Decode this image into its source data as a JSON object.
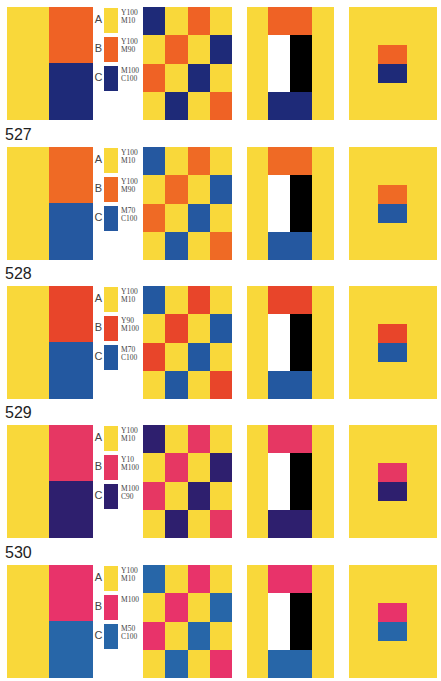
{
  "checker_pattern": [
    [
      "C",
      "A",
      "B",
      "A"
    ],
    [
      "A",
      "B",
      "A",
      "C"
    ],
    [
      "B",
      "A",
      "C",
      "A"
    ],
    [
      "A",
      "C",
      "A",
      "B"
    ]
  ],
  "rows": [
    {
      "number": "526",
      "colors": {
        "A": "#f9d83a",
        "B": "#ef6225",
        "C": "#1e2a78"
      },
      "labels": {
        "A": "A",
        "B": "B",
        "C": "C"
      },
      "codes": {
        "A": "Y100\nM10",
        "B": "Y100\nM90",
        "C": "M100\nC100"
      }
    },
    {
      "number": "527",
      "colors": {
        "A": "#f9d83a",
        "B": "#ef6a25",
        "C": "#2558a0"
      },
      "labels": {
        "A": "A",
        "B": "B",
        "C": "C"
      },
      "codes": {
        "A": "Y100\nM10",
        "B": "Y100\nM90",
        "C": "M70\nC100"
      }
    },
    {
      "number": "528",
      "colors": {
        "A": "#f9d83a",
        "B": "#e8452a",
        "C": "#2358a0"
      },
      "labels": {
        "A": "A",
        "B": "B",
        "C": "C"
      },
      "codes": {
        "A": "Y100\nM10",
        "B": "Y90\nM100",
        "C": "M70\nC100"
      }
    },
    {
      "number": "529",
      "colors": {
        "A": "#f9d83a",
        "B": "#e63763",
        "C": "#2e1f6e"
      },
      "labels": {
        "A": "A",
        "B": "B",
        "C": "C"
      },
      "codes": {
        "A": "Y100\nM10",
        "B": "Y10\nM100",
        "C": "M100\nC90"
      }
    },
    {
      "number": "530",
      "colors": {
        "A": "#f9d83a",
        "B": "#e8336a",
        "C": "#2766a8"
      },
      "labels": {
        "A": "A",
        "B": "B",
        "C": "C"
      },
      "codes": {
        "A": "Y100\nM10",
        "B": "M100",
        "C": "M50\nC100"
      }
    }
  ],
  "door_colors": {
    "white": "#ffffff",
    "black": "#000000"
  }
}
